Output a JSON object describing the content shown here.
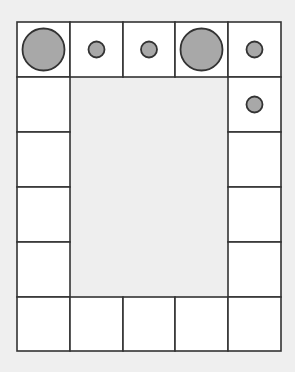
{
  "diagram": {
    "background": "#efefef",
    "cell_fill": "#ffffff",
    "inner_fill": "#eeeeee",
    "line_color": "#333333",
    "circle_fill": "#a8a8a8",
    "grid": {
      "x_lines": [
        17,
        70,
        123,
        175,
        228,
        281
      ],
      "y_lines": [
        22,
        77,
        132,
        187,
        242,
        297,
        351
      ],
      "columns": 5,
      "rows": 6
    },
    "border_cells": [
      {
        "row": 0,
        "col": 0,
        "circle": "large"
      },
      {
        "row": 0,
        "col": 1,
        "circle": "small"
      },
      {
        "row": 0,
        "col": 2,
        "circle": "small"
      },
      {
        "row": 0,
        "col": 3,
        "circle": "large"
      },
      {
        "row": 0,
        "col": 4,
        "circle": "small"
      },
      {
        "row": 1,
        "col": 0,
        "circle": "none"
      },
      {
        "row": 1,
        "col": 4,
        "circle": "small"
      },
      {
        "row": 2,
        "col": 0,
        "circle": "none"
      },
      {
        "row": 2,
        "col": 4,
        "circle": "none"
      },
      {
        "row": 3,
        "col": 0,
        "circle": "none"
      },
      {
        "row": 3,
        "col": 4,
        "circle": "none"
      },
      {
        "row": 4,
        "col": 0,
        "circle": "none"
      },
      {
        "row": 4,
        "col": 4,
        "circle": "none"
      },
      {
        "row": 5,
        "col": 0,
        "circle": "none"
      },
      {
        "row": 5,
        "col": 1,
        "circle": "none"
      },
      {
        "row": 5,
        "col": 2,
        "circle": "none"
      },
      {
        "row": 5,
        "col": 3,
        "circle": "none"
      },
      {
        "row": 5,
        "col": 4,
        "circle": "none"
      }
    ],
    "circle_radius": {
      "large": 21,
      "small": 8
    }
  }
}
